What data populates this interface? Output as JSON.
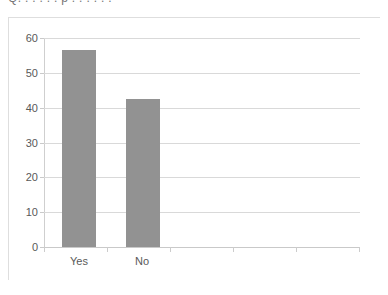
{
  "clipped_header": {
    "text": "Q.   . . . .   .   p . . . . . ."
  },
  "chart_data": {
    "type": "bar",
    "title": "",
    "subtitle": "",
    "xlabel": "",
    "ylabel": "",
    "categories": [
      "Yes",
      "No"
    ],
    "values": [
      56.5,
      42.5
    ],
    "series": [
      {
        "name": "Response",
        "values": [
          56.5,
          42.5
        ]
      }
    ],
    "ylim": [
      0,
      60
    ],
    "y_ticks": [
      0,
      10,
      20,
      30,
      40,
      50,
      60
    ],
    "y_tick_labels": [
      "0",
      "10",
      "20",
      "30",
      "40",
      "50",
      "60"
    ],
    "x_tick_labels": [
      "Yes",
      "No"
    ],
    "grid": true,
    "grid_axis": "y",
    "legend": false,
    "legend_position": "none",
    "bar_color": "#929292",
    "gridline_color": "#d9d9d9",
    "axis_color": "#cfcfcf",
    "text_color": "#595959",
    "background": "#ffffff",
    "empty_tick_slots": 3
  }
}
